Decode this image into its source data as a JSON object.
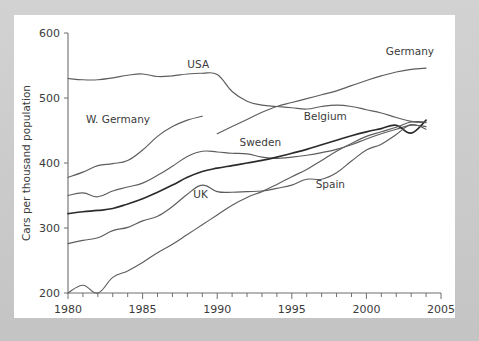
{
  "figure": {
    "background_color": "#c9c9c9",
    "card_color": "#ffffff",
    "line_color": "#5d5d5d",
    "emphasis_line_color": "#2b2b2b",
    "text_color": "#3b3b3b"
  },
  "chart_data": {
    "type": "line",
    "title": "",
    "subtitle": "",
    "xlabel": "",
    "ylabel": "Cars per thousand population",
    "xlim": [
      1980,
      2005
    ],
    "ylim": [
      200,
      600
    ],
    "xticks": [
      1980,
      1985,
      1990,
      1995,
      2000,
      2005
    ],
    "xtick_labels": [
      "1980",
      "1985",
      "1990",
      "1995",
      "2000",
      "2005"
    ],
    "yticks": [
      200,
      300,
      400,
      500,
      600
    ],
    "ytick_labels": [
      "200",
      "300",
      "400",
      "500",
      "600"
    ],
    "minor_xticks_interval": 1,
    "grid": false,
    "legend": "inline-labels",
    "legend_position": "inline",
    "series": [
      {
        "name": "USA",
        "label": "USA",
        "label_x": 1988.0,
        "label_y": 552,
        "emphasis": false,
        "x": [
          1980,
          1981,
          1982,
          1983,
          1984,
          1985,
          1986,
          1987,
          1988,
          1989,
          1990,
          1991,
          1992,
          1993,
          1994,
          1995,
          1996,
          1997,
          1998,
          1999,
          2000,
          2001,
          2002,
          2003,
          2004
        ],
        "values": [
          530,
          528,
          528,
          531,
          535,
          537,
          533,
          534,
          537,
          538,
          536,
          510,
          495,
          489,
          487,
          485,
          483,
          487,
          489,
          487,
          482,
          477,
          470,
          464,
          462
        ]
      },
      {
        "name": "Germany",
        "label": "Germany",
        "label_x": 2001.3,
        "label_y": 572,
        "emphasis": false,
        "x": [
          1990,
          1991,
          1992,
          1993,
          1994,
          1995,
          1996,
          1997,
          1998,
          1999,
          2000,
          2001,
          2002,
          2003,
          2004
        ],
        "values": [
          445,
          456,
          467,
          478,
          487,
          493,
          499,
          505,
          511,
          519,
          527,
          534,
          540,
          544,
          546
        ]
      },
      {
        "name": "W. Germany",
        "label": "W. Germany",
        "label_x": 1981.2,
        "label_y": 468,
        "emphasis": false,
        "x": [
          1980,
          1981,
          1982,
          1983,
          1984,
          1985,
          1986,
          1987,
          1988,
          1989
        ],
        "values": [
          378,
          386,
          396,
          399,
          404,
          420,
          441,
          456,
          466,
          472
        ]
      },
      {
        "name": "Sweden",
        "label": "Sweden",
        "label_x": 1991.5,
        "label_y": 432,
        "emphasis": false,
        "x": [
          1980,
          1981,
          1982,
          1983,
          1984,
          1985,
          1986,
          1987,
          1988,
          1989,
          1990,
          1991,
          1992,
          1993,
          1994,
          1995,
          1996,
          1997,
          1998,
          1999,
          2000,
          2001,
          2002,
          2003,
          2004
        ],
        "values": [
          350,
          354,
          348,
          357,
          363,
          369,
          381,
          395,
          410,
          418,
          417,
          415,
          414,
          409,
          407,
          409,
          412,
          416,
          421,
          428,
          437,
          445,
          452,
          458,
          456
        ]
      },
      {
        "name": "Belgium",
        "label": "Belgium",
        "label_x": 1995.8,
        "label_y": 473,
        "emphasis": true,
        "x": [
          1980,
          1981,
          1982,
          1983,
          1984,
          1985,
          1986,
          1987,
          1988,
          1989,
          1990,
          1991,
          1992,
          1993,
          1994,
          1995,
          1996,
          1997,
          1998,
          1999,
          2000,
          2001,
          2002,
          2003,
          2004
        ],
        "values": [
          322,
          325,
          327,
          330,
          337,
          345,
          355,
          366,
          378,
          387,
          392,
          396,
          400,
          404,
          409,
          415,
          421,
          428,
          435,
          442,
          448,
          453,
          458,
          446,
          466
        ]
      },
      {
        "name": "UK",
        "label": "UK",
        "label_x": 1988.4,
        "label_y": 352,
        "emphasis": false,
        "x": [
          1980,
          1981,
          1982,
          1983,
          1984,
          1985,
          1986,
          1987,
          1988,
          1989,
          1990,
          1991,
          1992,
          1993,
          1994,
          1995,
          1996,
          1997,
          1998,
          1999,
          2000,
          2001,
          2002,
          2003,
          2004
        ],
        "values": [
          276,
          281,
          285,
          296,
          301,
          311,
          318,
          333,
          352,
          366,
          356,
          355,
          356,
          357,
          361,
          366,
          375,
          375,
          385,
          403,
          420,
          429,
          444,
          459,
          452
        ]
      },
      {
        "name": "Spain",
        "label": "Spain",
        "label_x": 1996.6,
        "label_y": 368,
        "emphasis": false,
        "x": [
          1980,
          1981,
          1982,
          1983,
          1984,
          1985,
          1986,
          1987,
          1988,
          1989,
          1990,
          1991,
          1992,
          1993,
          1994,
          1995,
          1996,
          1997,
          1998,
          1999,
          2000,
          2001,
          2002,
          2003,
          2004
        ],
        "values": [
          200,
          212,
          200,
          224,
          234,
          247,
          262,
          275,
          290,
          305,
          320,
          335,
          347,
          356,
          367,
          379,
          390,
          404,
          418,
          430,
          441,
          448,
          455,
          463,
          463
        ]
      }
    ]
  }
}
